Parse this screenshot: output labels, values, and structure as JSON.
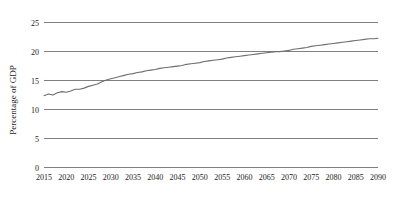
{
  "chart_data": {
    "type": "line",
    "title": "",
    "subtitle": "",
    "xlabel": "",
    "ylabel": "Percentage of GDP",
    "xlim": [
      2015,
      2090
    ],
    "ylim": [
      0,
      25
    ],
    "grid": "horizontal",
    "legend": "none",
    "y_ticks": [
      "0",
      "5",
      "10",
      "15",
      "20",
      "25"
    ],
    "y_tick_values": [
      0,
      5,
      10,
      15,
      20,
      25
    ],
    "x_ticks": [
      "2015",
      "2020",
      "2025",
      "2030",
      "2035",
      "2040",
      "2045",
      "2050",
      "2055",
      "2060",
      "2065",
      "2070",
      "2075",
      "2080",
      "2085",
      "2090"
    ],
    "x_tick_values": [
      2015,
      2020,
      2025,
      2030,
      2035,
      2040,
      2045,
      2050,
      2055,
      2060,
      2065,
      2070,
      2075,
      2080,
      2085,
      2090
    ],
    "line_color": "#6e6e6e",
    "grid_color": "#808080",
    "background_color": "#ffffff",
    "series": [
      {
        "name": "Percentage of GDP",
        "x": [
          2015,
          2016,
          2017,
          2018,
          2019,
          2020,
          2021,
          2022,
          2023,
          2024,
          2025,
          2026,
          2027,
          2028,
          2029,
          2030,
          2031,
          2032,
          2033,
          2034,
          2035,
          2036,
          2037,
          2038,
          2039,
          2040,
          2041,
          2042,
          2043,
          2044,
          2045,
          2046,
          2047,
          2048,
          2049,
          2050,
          2051,
          2052,
          2053,
          2054,
          2055,
          2056,
          2057,
          2058,
          2059,
          2060,
          2061,
          2062,
          2063,
          2064,
          2065,
          2066,
          2067,
          2068,
          2069,
          2070,
          2071,
          2072,
          2073,
          2074,
          2075,
          2076,
          2077,
          2078,
          2079,
          2080,
          2081,
          2082,
          2083,
          2084,
          2085,
          2086,
          2087,
          2088,
          2089,
          2090
        ],
        "values": [
          12.3,
          12.6,
          12.4,
          12.8,
          13.0,
          12.9,
          13.1,
          13.4,
          13.4,
          13.6,
          13.9,
          14.1,
          14.3,
          14.7,
          15.0,
          15.2,
          15.4,
          15.6,
          15.8,
          16.0,
          16.1,
          16.3,
          16.4,
          16.6,
          16.7,
          16.8,
          17.0,
          17.1,
          17.2,
          17.3,
          17.4,
          17.5,
          17.7,
          17.8,
          17.9,
          18.0,
          18.2,
          18.3,
          18.4,
          18.5,
          18.6,
          18.8,
          18.9,
          19.0,
          19.1,
          19.2,
          19.3,
          19.4,
          19.5,
          19.6,
          19.7,
          19.8,
          19.9,
          19.9,
          20.0,
          20.1,
          20.3,
          20.4,
          20.5,
          20.6,
          20.8,
          20.9,
          21.0,
          21.1,
          21.2,
          21.3,
          21.4,
          21.5,
          21.6,
          21.7,
          21.8,
          21.9,
          22.0,
          22.1,
          22.1,
          22.2
        ]
      }
    ]
  }
}
